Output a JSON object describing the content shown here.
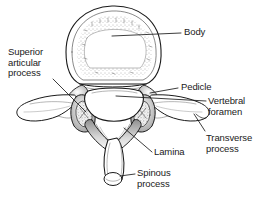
{
  "figure": {
    "background_color": "#ffffff",
    "ink_color": "#1a1a1a",
    "view": "superior"
  },
  "labels": {
    "body": "Body",
    "superior_articular_process": "Superior\narticular\nprocess",
    "pedicle": "Pedicle",
    "vertebral_foramen": "Vertebral\nforamen",
    "transverse_process": "Transverse\nprocess",
    "lamina": "Lamina",
    "spinous_process": "Spinous\nprocess"
  },
  "parts": [
    {
      "id": "body",
      "label": "Body"
    },
    {
      "id": "superior-articular-process",
      "label": "Superior articular process"
    },
    {
      "id": "pedicle",
      "label": "Pedicle"
    },
    {
      "id": "vertebral-foramen",
      "label": "Vertebral foramen"
    },
    {
      "id": "transverse-process",
      "label": "Transverse process"
    },
    {
      "id": "lamina",
      "label": "Lamina"
    },
    {
      "id": "spinous-process",
      "label": "Spinous process"
    }
  ]
}
